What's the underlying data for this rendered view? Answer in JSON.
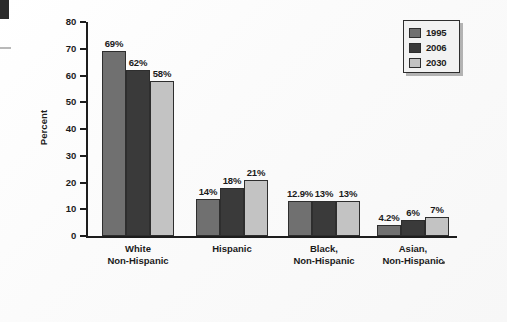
{
  "chart_data": {
    "type": "bar",
    "title": "",
    "xlabel": "",
    "ylabel": "Percent",
    "ylim": [
      0,
      80
    ],
    "yticks": [
      0,
      10,
      20,
      30,
      40,
      50,
      60,
      70,
      80
    ],
    "ytick_labels": [
      "0",
      "10",
      "20",
      "30",
      "40",
      "50",
      "60",
      "70",
      "80"
    ],
    "grid": false,
    "legend_position": "top-right",
    "categories": [
      "White\nNon-Hispanic",
      "Hispanic",
      "Black,\nNon-Hispanic",
      "Asian,\nNon-Hispanic"
    ],
    "category_lines": [
      [
        "White",
        "Non-Hispanic"
      ],
      [
        "Hispanic",
        ""
      ],
      [
        "Black,",
        "Non-Hispanic"
      ],
      [
        "Asian,",
        "Non-Hispanic"
      ]
    ],
    "series": [
      {
        "name": "1995",
        "color": "#707070",
        "values": [
          69,
          14,
          12.9,
          4.2
        ],
        "labels": [
          "69%",
          "14%",
          "12.9%",
          "4.2%"
        ]
      },
      {
        "name": "2006",
        "color": "#3a3a3a",
        "values": [
          62,
          18,
          13,
          6
        ],
        "labels": [
          "62%",
          "18%",
          "13%",
          "6%"
        ]
      },
      {
        "name": "2030",
        "color": "#c3c3c3",
        "values": [
          58,
          21,
          13,
          7
        ],
        "labels": [
          "58%",
          "21%",
          "13%",
          "7%"
        ]
      }
    ]
  },
  "legend": {
    "entries": [
      {
        "label": "1995",
        "color": "#707070"
      },
      {
        "label": "2006",
        "color": "#3a3a3a"
      },
      {
        "label": "2030",
        "color": "#c3c3c3"
      }
    ]
  }
}
